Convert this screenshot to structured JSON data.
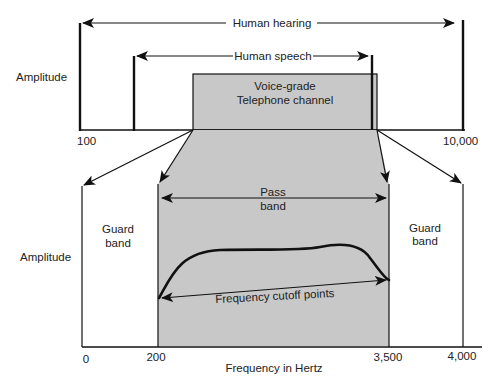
{
  "top_panel": {
    "y_axis_label": "Amplitude",
    "x_tick_left": "100",
    "x_tick_right": "10,000",
    "human_hearing_label": "Human hearing",
    "human_speech_label": "Human speech",
    "channel_label_line1": "Voice-grade",
    "channel_label_line2": "Telephone channel"
  },
  "bottom_panel": {
    "y_axis_label": "Amplitude",
    "x_axis_label": "Frequency in Hertz",
    "x_ticks": [
      "0",
      "200",
      "3,500",
      "4,000"
    ],
    "guard_band_left_line1": "Guard",
    "guard_band_left_line2": "band",
    "guard_band_right_line1": "Guard",
    "guard_band_right_line2": "band",
    "pass_band_line1": "Pass",
    "pass_band_line2": "band",
    "cutoff_label": "Frequency cutoff points"
  },
  "colors": {
    "channel_fill": "#c8c8c8",
    "line": "#111111"
  }
}
